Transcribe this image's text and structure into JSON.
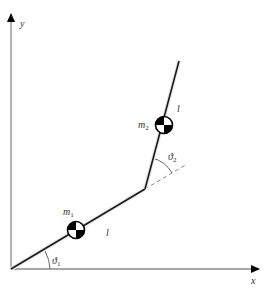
{
  "diagram": {
    "axes": {
      "x_label": "x",
      "y_label": "y"
    },
    "links": [
      {
        "name": "link-1",
        "length_label": "l"
      },
      {
        "name": "link-2",
        "length_label": "l"
      }
    ],
    "masses": [
      {
        "name": "m1",
        "label": "m",
        "subscript": "1"
      },
      {
        "name": "m2",
        "label": "m",
        "subscript": "2"
      }
    ],
    "angles": [
      {
        "name": "theta1",
        "symbol": "ϑ",
        "subscript": "1"
      },
      {
        "name": "theta2",
        "symbol": "ϑ",
        "subscript": "2"
      }
    ],
    "colors": {
      "axis": "#8a8a8a",
      "link": "#1a1a1a",
      "dashed": "#888888",
      "text": "#333333"
    }
  }
}
